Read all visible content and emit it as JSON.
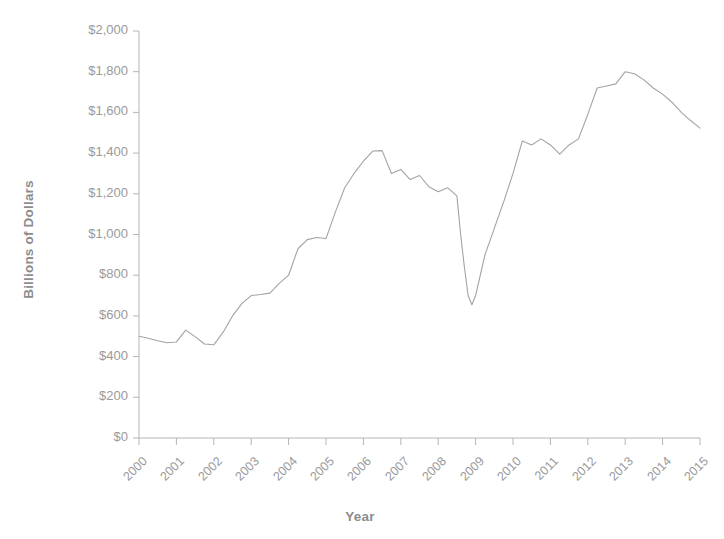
{
  "chart_data": {
    "type": "line",
    "title": "",
    "xlabel": "Year",
    "ylabel": "Billions of Dollars",
    "xlim": [
      2000,
      2015
    ],
    "ylim": [
      0,
      2000
    ],
    "grid": false,
    "legend": null,
    "line_color": "#a3a3a3",
    "axis_color": "#b0b0b0",
    "text_color": "#9a9a9a",
    "y_ticks": [
      "$0",
      "$200",
      "$400",
      "$600",
      "$800",
      "$1,000",
      "$1,200",
      "$1,400",
      "$1,600",
      "$1,800",
      "$2,000"
    ],
    "y_tick_values": [
      0,
      200,
      400,
      600,
      800,
      1000,
      1200,
      1400,
      1600,
      1800,
      2000
    ],
    "x_ticks": [
      "2000",
      "2001",
      "2002",
      "2003",
      "2004",
      "2005",
      "2006",
      "2007",
      "2008",
      "2009",
      "2010",
      "2011",
      "2012",
      "2013",
      "2014",
      "2015"
    ],
    "x_tick_values": [
      2000,
      2001,
      2002,
      2003,
      2004,
      2005,
      2006,
      2007,
      2008,
      2009,
      2010,
      2011,
      2012,
      2013,
      2014,
      2015
    ],
    "x": [
      2000.0,
      2000.25,
      2000.5,
      2000.75,
      2001.0,
      2001.25,
      2001.5,
      2001.75,
      2002.0,
      2002.25,
      2002.5,
      2002.75,
      2003.0,
      2003.25,
      2003.5,
      2003.75,
      2004.0,
      2004.25,
      2004.5,
      2004.75,
      2005.0,
      2005.25,
      2005.5,
      2005.75,
      2006.0,
      2006.25,
      2006.5,
      2006.75,
      2007.0,
      2007.25,
      2007.5,
      2007.75,
      2008.0,
      2008.25,
      2008.5,
      2008.6,
      2008.7,
      2008.8,
      2008.9,
      2009.0,
      2009.25,
      2009.5,
      2009.75,
      2010.0,
      2010.25,
      2010.5,
      2010.75,
      2011.0,
      2011.25,
      2011.5,
      2011.75,
      2012.0,
      2012.25,
      2012.5,
      2012.75,
      2013.0,
      2013.25,
      2013.5,
      2013.75,
      2014.0,
      2014.25,
      2014.5,
      2014.75,
      2015.0
    ],
    "y": [
      500,
      490,
      478,
      468,
      472,
      530,
      498,
      462,
      458,
      520,
      600,
      660,
      700,
      705,
      712,
      760,
      800,
      930,
      975,
      985,
      980,
      1110,
      1230,
      1300,
      1360,
      1410,
      1412,
      1300,
      1320,
      1270,
      1290,
      1235,
      1210,
      1230,
      1190,
      1000,
      840,
      700,
      655,
      700,
      900,
      1030,
      1160,
      1300,
      1460,
      1440,
      1470,
      1440,
      1395,
      1440,
      1470,
      1590,
      1720,
      1730,
      1740,
      1800,
      1790,
      1760,
      1720,
      1690,
      1650,
      1600,
      1560,
      1523
    ],
    "series_name": "value",
    "plot_area": {
      "left_px": 139,
      "right_px": 700,
      "top_px": 31,
      "bottom_px": 438
    }
  }
}
